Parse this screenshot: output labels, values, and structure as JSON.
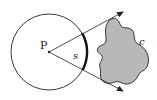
{
  "diagram": {
    "labels": {
      "point": "P",
      "arc": "s",
      "surface": "c"
    },
    "colors": {
      "stroke": "#222222",
      "blob_fill": "#b8b8b8",
      "background": "#ffffff"
    }
  }
}
